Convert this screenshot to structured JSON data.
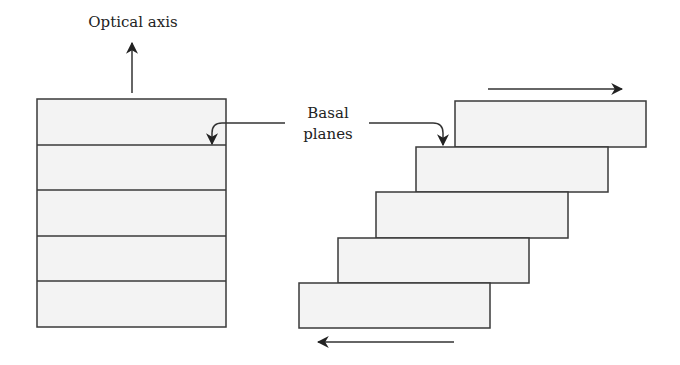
{
  "labels": {
    "optical_axis": "Optical axis",
    "basal_line1": "Basal",
    "basal_line2": "planes"
  },
  "colors": {
    "layer_fill": "#f3f3f3",
    "stroke": "#3a3a3a",
    "text": "#222222"
  },
  "left_stack": {
    "x": 37,
    "width": 189,
    "layers": [
      {
        "y": 99,
        "h": 46
      },
      {
        "y": 145,
        "h": 45
      },
      {
        "y": 190,
        "h": 46
      },
      {
        "y": 236,
        "h": 45
      },
      {
        "y": 281,
        "h": 46
      }
    ]
  },
  "right_stack": {
    "layers": [
      {
        "x": 455,
        "y": 101,
        "w": 191,
        "h": 46
      },
      {
        "x": 416,
        "y": 147,
        "w": 192,
        "h": 45
      },
      {
        "x": 376,
        "y": 192,
        "w": 192,
        "h": 46
      },
      {
        "x": 338,
        "y": 238,
        "w": 191,
        "h": 45
      },
      {
        "x": 299,
        "y": 283,
        "w": 191,
        "h": 45
      }
    ]
  },
  "arrows": {
    "optical_axis": "up",
    "shear_top": "right",
    "shear_bottom": "left"
  }
}
